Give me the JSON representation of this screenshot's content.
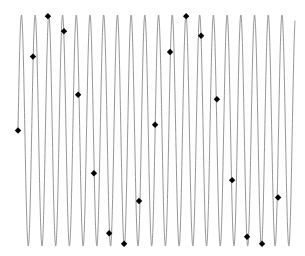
{
  "chart_data": {
    "type": "line",
    "title": "",
    "xlabel": "",
    "ylabel": "",
    "grid": false,
    "legend": null,
    "axes_visible": false,
    "series": [
      {
        "name": "signal",
        "style": "line",
        "color": "#8a8a8a",
        "function": "sin",
        "amplitude": 1.0,
        "cycles": 20.2,
        "x_start": 0,
        "x_end": 1
      },
      {
        "name": "samples",
        "style": "diamond-markers",
        "color": "#000000",
        "points": [
          {
            "x": 0.0,
            "y": 0.0
          },
          {
            "x": 0.054,
            "y": 0.64
          },
          {
            "x": 0.108,
            "y": 0.99
          },
          {
            "x": 0.166,
            "y": 0.86
          },
          {
            "x": 0.217,
            "y": 0.31
          },
          {
            "x": 0.274,
            "y": -0.37
          },
          {
            "x": 0.329,
            "y": -0.89
          },
          {
            "x": 0.383,
            "y": -0.98
          },
          {
            "x": 0.437,
            "y": -0.61
          },
          {
            "x": 0.495,
            "y": 0.05
          },
          {
            "x": 0.549,
            "y": 0.68
          },
          {
            "x": 0.607,
            "y": 0.99
          },
          {
            "x": 0.661,
            "y": 0.82
          },
          {
            "x": 0.718,
            "y": 0.27
          },
          {
            "x": 0.773,
            "y": -0.43
          },
          {
            "x": 0.827,
            "y": -0.92
          },
          {
            "x": 0.881,
            "y": -0.98
          },
          {
            "x": 0.939,
            "y": -0.58
          }
        ]
      }
    ],
    "xlim": [
      0,
      1
    ],
    "ylim": [
      -1,
      1
    ]
  },
  "layout": {
    "plot_left_px": 18,
    "plot_right_px": 295,
    "center_y_px": 130.5,
    "amplitude_px": 115.5
  }
}
